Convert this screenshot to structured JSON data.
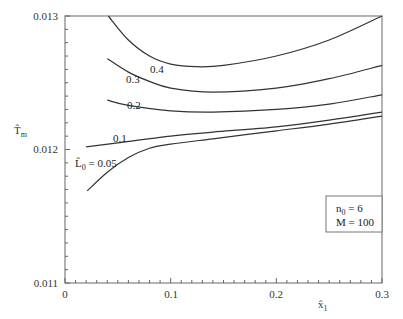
{
  "chart_data": {
    "type": "line",
    "title": "",
    "xlabel": "x̂₁",
    "ylabel": "T̂m",
    "xlim": [
      0,
      0.3
    ],
    "ylim": [
      0.011,
      0.013
    ],
    "grid": false,
    "x_ticks": [
      "0",
      "0.1",
      "0.2",
      "0.3"
    ],
    "y_ticks": [
      "0.011",
      "0.012",
      "0.013"
    ],
    "legend_box": {
      "lines": [
        "n0 = 6",
        "M = 100"
      ],
      "position": "lower-right"
    },
    "series_param_name": "L̂0",
    "series": [
      {
        "name": "0.05",
        "label": "L̂0 = 0.05",
        "x": [
          0.021,
          0.04,
          0.06,
          0.08,
          0.1,
          0.14,
          0.2,
          0.25,
          0.3
        ],
        "y": [
          0.01169,
          0.01183,
          0.01194,
          0.01201,
          0.01204,
          0.01208,
          0.01214,
          0.01219,
          0.01225
        ]
      },
      {
        "name": "0.1",
        "label": "0.1",
        "x": [
          0.02,
          0.05,
          0.1,
          0.14,
          0.2,
          0.25,
          0.3
        ],
        "y": [
          0.01202,
          0.01205,
          0.0121,
          0.01213,
          0.01217,
          0.01222,
          0.01228
        ]
      },
      {
        "name": "0.2",
        "label": "0.2",
        "x": [
          0.04,
          0.06,
          0.1,
          0.14,
          0.2,
          0.25,
          0.3
        ],
        "y": [
          0.01237,
          0.01233,
          0.01229,
          0.01228,
          0.0123,
          0.01234,
          0.01241
        ]
      },
      {
        "name": "0.3",
        "label": "0.3",
        "x": [
          0.04,
          0.06,
          0.08,
          0.1,
          0.14,
          0.2,
          0.25,
          0.3
        ],
        "y": [
          0.01268,
          0.01258,
          0.01251,
          0.01246,
          0.01243,
          0.01246,
          0.01253,
          0.01263
        ]
      },
      {
        "name": "0.4",
        "label": "0.4",
        "x": [
          0.041,
          0.06,
          0.08,
          0.1,
          0.124,
          0.15,
          0.2,
          0.25,
          0.3
        ],
        "y": [
          0.013,
          0.01282,
          0.0127,
          0.01264,
          0.01262,
          0.01263,
          0.0127,
          0.01282,
          0.013
        ]
      }
    ]
  },
  "labels": {
    "y_axis": "T̂",
    "y_axis_sub": "m",
    "x_axis": "x̂",
    "x_axis_sub": "1",
    "legend_line1": "n",
    "legend_line1_sub": "0",
    "legend_line1_rest": " = 6",
    "legend_line2": "M = 100",
    "curve_0_05_prefix": "L̂",
    "curve_0_05_sub": "0",
    "curve_0_05_rest": " = 0.05",
    "curve_0_1": "0.1",
    "curve_0_2": "0.2",
    "curve_0_3": "0.3",
    "curve_0_4": "0.4",
    "tick_x0": "0",
    "tick_x1": "0.1",
    "tick_x2": "0.2",
    "tick_x3": "0.3",
    "tick_y0": "0.011",
    "tick_y1": "0.012",
    "tick_y2": "0.013"
  },
  "colors": {
    "line": "#333333",
    "frame": "#555555",
    "background": "#ffffff"
  }
}
